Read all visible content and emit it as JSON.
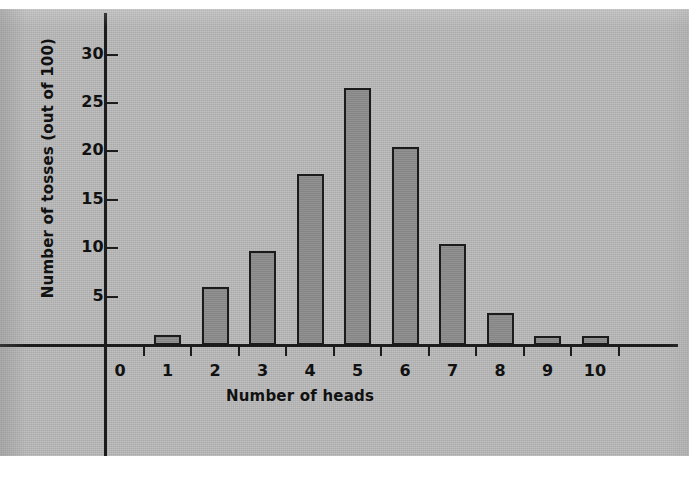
{
  "figure": {
    "kind": "scanned-textbook-bar-chart",
    "background_color": "#b9b9b9",
    "ink_color": "#1b1b1b",
    "bar_fill_color": "#8c8c8c"
  },
  "chart_data": {
    "type": "bar",
    "title": "",
    "xlabel": "Number of heads",
    "ylabel": "Number of tosses (out of 100)",
    "categories": [
      "0",
      "1",
      "2",
      "3",
      "4",
      "5",
      "6",
      "7",
      "8",
      "9",
      "10"
    ],
    "values": [
      0,
      1,
      6,
      9.7,
      17.7,
      26.6,
      20.5,
      10.4,
      3.3,
      0.9,
      0.9
    ],
    "ytick_labels": [
      "5",
      "10",
      "15",
      "20",
      "25",
      "30"
    ],
    "ytick_values": [
      5,
      10,
      15,
      20,
      25,
      30
    ],
    "ylim": [
      0,
      33
    ],
    "xlim": [
      -0.5,
      10.5
    ],
    "grid": false,
    "legend": false
  }
}
